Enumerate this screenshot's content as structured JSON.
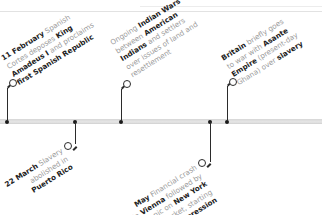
{
  "events": [
    {
      "id": "spanish-republic",
      "position": "above",
      "lines": [
        [
          {
            "b": "11 February"
          },
          {
            "t": " Spanish"
          }
        ],
        [
          {
            "t": "Cortes deposes "
          },
          {
            "b": "King"
          }
        ],
        [
          {
            "b": "Amadeus I"
          },
          {
            "t": " and proclaims"
          }
        ],
        [
          {
            "b": "first Spanish Republic"
          }
        ]
      ]
    },
    {
      "id": "puerto-rico",
      "position": "below",
      "lines": [
        [
          {
            "b": "22 March"
          },
          {
            "t": " Slavery"
          }
        ],
        [
          {
            "t": "abolished in"
          }
        ],
        [
          {
            "b": "Puerto Rico"
          }
        ]
      ]
    },
    {
      "id": "indian-wars",
      "position": "above",
      "lines": [
        [
          {
            "t": "Ongoing "
          },
          {
            "b": "Indian Wars"
          }
        ],
        [
          {
            "t": "between "
          },
          {
            "b": "American"
          }
        ],
        [
          {
            "b": "Indians"
          },
          {
            "t": " and settlers"
          }
        ],
        [
          {
            "t": "over issues of land and"
          }
        ],
        [
          {
            "t": "resettlement"
          }
        ]
      ]
    },
    {
      "id": "long-depression",
      "position": "below",
      "lines": [
        [
          {
            "b": "May"
          },
          {
            "t": " Financial crash"
          }
        ],
        [
          {
            "t": "in "
          },
          {
            "b": "Vienna"
          },
          {
            "t": " followed by"
          }
        ],
        [
          {
            "t": "later panic on "
          },
          {
            "b": "New York"
          }
        ],
        [
          {
            "t": "stock market, starting"
          }
        ],
        [
          {
            "b": "Long Depression"
          }
        ]
      ]
    },
    {
      "id": "asante",
      "position": "above",
      "lines": [
        [
          {
            "b": "Britain"
          },
          {
            "t": " briefly goes"
          }
        ],
        [
          {
            "t": "to war with "
          },
          {
            "b": "Asante"
          }
        ],
        [
          {
            "b": "Empire"
          },
          {
            "t": " (present-day"
          }
        ],
        [
          {
            "t": "Ghana) over "
          },
          {
            "b": "slavery"
          }
        ]
      ]
    }
  ],
  "colors": {
    "bold_text": "#222222",
    "body_text": "#9a9a9a",
    "connector": "#2b2b2b",
    "bar": "#dddddd"
  }
}
